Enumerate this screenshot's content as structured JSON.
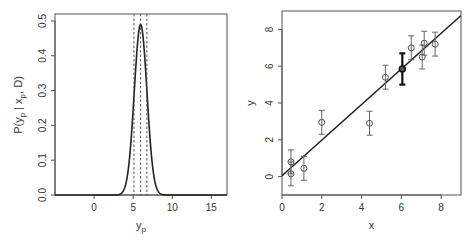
{
  "chart_data": [
    {
      "type": "line",
      "title": "",
      "xlabel": "y_p",
      "ylabel": "P(y_p | x_p, D)",
      "xlim": [
        -5,
        17
      ],
      "ylim": [
        0,
        0.52
      ],
      "xticks": [
        0,
        5,
        10,
        15
      ],
      "xtick_labels": [
        "0",
        "5",
        "10",
        "15"
      ],
      "yticks": [
        0.0,
        0.1,
        0.2,
        0.3,
        0.4,
        0.5
      ],
      "ytick_labels": [
        "0.0",
        "0.1",
        "0.2",
        "0.3",
        "0.4",
        "0.5"
      ],
      "series": [
        {
          "name": "predictive density",
          "distribution": "normal",
          "mean": 5.95,
          "sd": 0.81,
          "peak": 0.49,
          "style": "solid"
        }
      ],
      "vlines": [
        {
          "x": 5.1,
          "style": "dashed"
        },
        {
          "x": 5.95,
          "style": "dashed"
        },
        {
          "x": 6.75,
          "style": "dashed"
        }
      ],
      "grid": false,
      "legend": "none"
    },
    {
      "type": "scatter",
      "title": "",
      "xlabel": "x",
      "ylabel": "y",
      "xlim": [
        0,
        9
      ],
      "ylim": [
        -1,
        9
      ],
      "xticks": [
        0,
        2,
        4,
        6,
        8
      ],
      "xtick_labels": [
        "0",
        "2",
        "4",
        "6",
        "8"
      ],
      "yticks": [
        0,
        2,
        4,
        6,
        8
      ],
      "ytick_labels": [
        "0",
        "2",
        "4",
        "6",
        "8"
      ],
      "points": [
        {
          "x": 0.45,
          "y": 0.8,
          "err": 0.65
        },
        {
          "x": 0.45,
          "y": 0.15,
          "err": 0.65
        },
        {
          "x": 1.1,
          "y": 0.45,
          "err": 0.65
        },
        {
          "x": 2.0,
          "y": 2.95,
          "err": 0.65
        },
        {
          "x": 4.4,
          "y": 2.9,
          "err": 0.65
        },
        {
          "x": 5.2,
          "y": 5.4,
          "err": 0.65
        },
        {
          "x": 6.5,
          "y": 7.0,
          "err": 0.65
        },
        {
          "x": 7.05,
          "y": 6.5,
          "err": 0.65
        },
        {
          "x": 7.15,
          "y": 7.25,
          "err": 0.65
        },
        {
          "x": 7.7,
          "y": 7.2,
          "err": 0.65
        }
      ],
      "prediction": {
        "x": 6.05,
        "y": 5.85,
        "err": 0.85
      },
      "fit_line": {
        "intercept": 0.05,
        "slope": 0.967
      },
      "grid": false,
      "legend": "none"
    }
  ]
}
